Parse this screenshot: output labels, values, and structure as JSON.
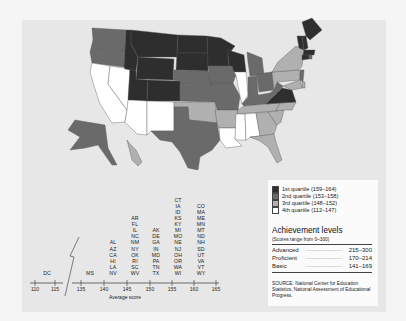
{
  "chart_data": {
    "type": "choropleth-map",
    "title": "",
    "legend": {
      "quartiles": [
        {
          "label": "1st quartile (159–164)",
          "color": "#2e2e2e"
        },
        {
          "label": "2nd quartile (153–158)",
          "color": "#6a6a6a"
        },
        {
          "label": "3rd quartile (148–152)",
          "color": "#b0b0b0"
        },
        {
          "label": "4th quartile (112–147)",
          "color": "#ffffff"
        }
      ]
    },
    "state_quartiles": {
      "q1": [
        "ME",
        "NH",
        "VT",
        "MA",
        "MT",
        "ND",
        "SD",
        "MN",
        "WI",
        "WY",
        "ID",
        "UT",
        "CO",
        "VA",
        "CT"
      ],
      "q2": [
        "WA",
        "OR",
        "NE",
        "KS",
        "IA",
        "MO",
        "MI",
        "IN",
        "OH",
        "KY",
        "TX",
        "AK",
        "RI",
        "NJ",
        "WV",
        "NY-border"
      ],
      "q3": [
        "NY",
        "PA",
        "OK",
        "AR",
        "TN",
        "NC",
        "SC",
        "GA",
        "FL",
        "DE",
        "MD",
        "HI"
      ],
      "q4": [
        "CA",
        "NV",
        "AZ",
        "NM",
        "IL",
        "LA",
        "MS",
        "AL",
        "DC"
      ]
    },
    "dotplot": {
      "xlabel": "Average score",
      "ticks": [
        "110",
        "115",
        "135",
        "140",
        "145",
        "150",
        "155",
        "160",
        "165"
      ],
      "axis_break": "between 115 and 135",
      "columns": [
        {
          "score": "~113",
          "states": [
            "DC"
          ]
        },
        {
          "score": "~137",
          "states": [
            "MS"
          ]
        },
        {
          "score": "~143",
          "states": [
            "AL",
            "AZ",
            "CA",
            "HI",
            "LA",
            "NV"
          ]
        },
        {
          "score": "~147",
          "states": [
            "AR",
            "FL",
            "IL",
            "NC",
            "NM",
            "NY",
            "OK",
            "RI",
            "SC",
            "WV"
          ]
        },
        {
          "score": "~152",
          "states": [
            "AK",
            "DE",
            "GA",
            "IN",
            "MD",
            "PA",
            "TN",
            "TX"
          ]
        },
        {
          "score": "~157",
          "states": [
            "CT",
            "IA",
            "ID",
            "KS",
            "KY",
            "MI",
            "MO",
            "NE",
            "NJ",
            "OH",
            "OR",
            "WA",
            "WI"
          ]
        },
        {
          "score": "~162",
          "states": [
            "CO",
            "MA",
            "ME",
            "MN",
            "MT",
            "ND",
            "NH",
            "SD",
            "UT",
            "VA",
            "VT",
            "WY"
          ]
        }
      ]
    }
  },
  "legend": {
    "quartiles": [
      {
        "label": "1st quartile (159–164)"
      },
      {
        "label": "2nd quartile (153–158)"
      },
      {
        "label": "3rd quartile (148–152)"
      },
      {
        "label": "4th quartile (112–147)"
      }
    ],
    "achievement_title": "Achievement levels",
    "achievement_subtitle": "(Scores range from 0–300)",
    "levels": [
      {
        "name": "Advanced",
        "range": "215–300"
      },
      {
        "name": "Proficient",
        "range": "170–214"
      },
      {
        "name": "Basic",
        "range": "141–169"
      }
    ],
    "source": "SOURCE: National Center for Education Statistics, National Assessment of Educational Progress."
  }
}
